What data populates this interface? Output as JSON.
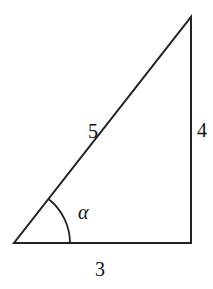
{
  "diagram": {
    "type": "right-triangle",
    "stroke_color": "#222222",
    "vertices": {
      "bottom_left": [
        14,
        243
      ],
      "bottom_right": [
        191,
        243
      ],
      "top_right": [
        191,
        17
      ]
    },
    "labels": {
      "hypotenuse": "5",
      "vertical_side": "4",
      "base": "3",
      "angle": "α"
    },
    "angle_arc_radius": 56
  }
}
